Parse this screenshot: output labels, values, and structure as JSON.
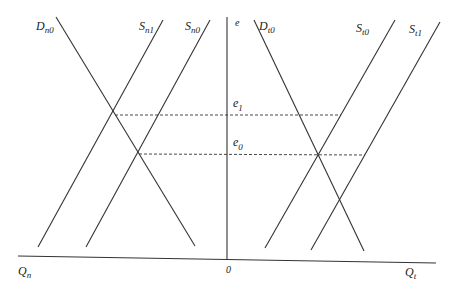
{
  "diagram": {
    "title": "",
    "colors": {
      "line": "#333333",
      "dashed": "#333333",
      "text": "#222222",
      "background": "#ffffff"
    },
    "axes": {
      "vertical_label": "e",
      "origin_label": "0",
      "left_axis_label": {
        "main": "Q",
        "sub": "n"
      },
      "right_axis_label": {
        "main": "Q",
        "sub": "t"
      }
    },
    "levels": [
      {
        "main": "e",
        "sub": "1"
      },
      {
        "main": "e",
        "sub": "0"
      }
    ],
    "curves": [
      {
        "id": "D_n0",
        "main": "D",
        "sub": "n0",
        "type": "demand",
        "x1": 56,
        "y1": 17,
        "x2": 195,
        "y2": 246
      },
      {
        "id": "S_n1",
        "main": "S",
        "sub": "n1",
        "type": "supply",
        "x1": 163,
        "y1": 20,
        "x2": 38,
        "y2": 247
      },
      {
        "id": "S_n0",
        "main": "S",
        "sub": "n0",
        "type": "supply",
        "x1": 210,
        "y1": 20,
        "x2": 86,
        "y2": 247
      },
      {
        "id": "D_t0",
        "main": "D",
        "sub": "t0",
        "type": "demand",
        "x1": 254,
        "y1": 20,
        "x2": 364,
        "y2": 251
      },
      {
        "id": "S_t0",
        "main": "S",
        "sub": "t0",
        "type": "supply",
        "x1": 395,
        "y1": 20,
        "x2": 265,
        "y2": 248
      },
      {
        "id": "S_t1",
        "main": "S",
        "sub": "t1",
        "type": "supply",
        "x1": 440,
        "y1": 22,
        "x2": 311,
        "y2": 250
      }
    ],
    "dashed_lines": [
      {
        "level": "e1",
        "x1": 115,
        "y1": 115,
        "x2": 341,
        "y2": 115
      },
      {
        "level": "e0",
        "x1": 139,
        "y1": 154,
        "x2": 365,
        "y2": 155
      }
    ]
  }
}
